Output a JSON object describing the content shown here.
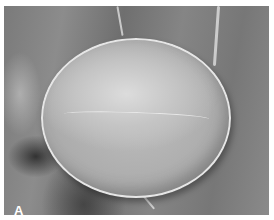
{
  "figure": {
    "panel_label": "A",
    "colors": {
      "background_gray": "#7f7f7f",
      "grain_gray": "#c0c0c0",
      "label": "#ffffff",
      "border": "#ffffff"
    }
  }
}
